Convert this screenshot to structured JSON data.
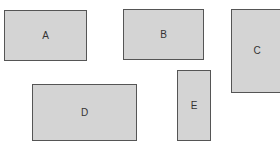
{
  "diagram": {
    "fill_color": "#d4d4d4",
    "border_color": "#555555",
    "shapes": [
      {
        "id": "A",
        "label": "A",
        "x": 4,
        "y": 10,
        "w": 83,
        "h": 51
      },
      {
        "id": "B",
        "label": "B",
        "x": 123,
        "y": 9,
        "w": 81,
        "h": 51
      },
      {
        "id": "C",
        "label": "C",
        "x": 231,
        "y": 9,
        "w": 52,
        "h": 84
      },
      {
        "id": "D",
        "label": "D",
        "x": 32,
        "y": 84,
        "w": 105,
        "h": 57
      },
      {
        "id": "E",
        "label": "E",
        "x": 177,
        "y": 70,
        "w": 34,
        "h": 71
      }
    ]
  }
}
